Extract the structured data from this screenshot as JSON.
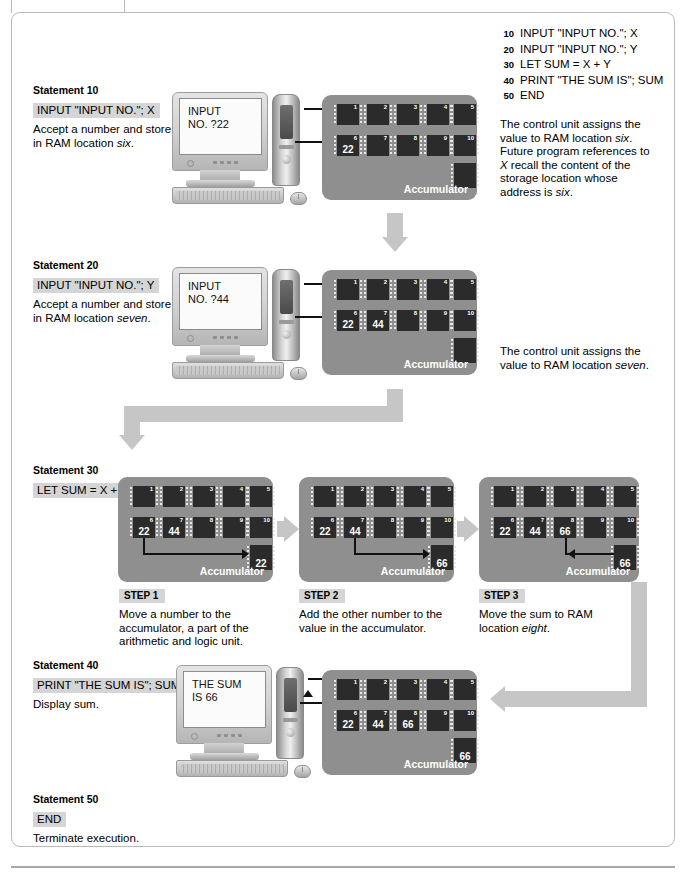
{
  "program_listing": [
    {
      "line": "10",
      "code": "INPUT \"INPUT NO.\"; X"
    },
    {
      "line": "20",
      "code": "INPUT \"INPUT NO.\"; Y"
    },
    {
      "line": "30",
      "code": "LET SUM = X + Y"
    },
    {
      "line": "40",
      "code": "PRINT \"THE SUM IS\"; SUM"
    },
    {
      "line": "50",
      "code": "END"
    }
  ],
  "statements": {
    "s10": {
      "title": "Statement 10",
      "code": "INPUT \"INPUT NO.\"; X",
      "desc_pre": "Accept a number and store it in RAM location ",
      "desc_em": "six",
      "desc_post": "."
    },
    "s20": {
      "title": "Statement 20",
      "code": "INPUT \"INPUT NO.\"; Y",
      "desc_pre": "Accept a number and store it in RAM location ",
      "desc_em": "seven",
      "desc_post": "."
    },
    "s30": {
      "title": "Statement 30",
      "code": "LET SUM = X + Y"
    },
    "s40": {
      "title": "Statement 40",
      "code": "PRINT \"THE SUM IS\"; SUM",
      "desc": "Display sum."
    },
    "s50": {
      "title": "Statement 50",
      "code": "END",
      "desc": "Terminate execution."
    }
  },
  "notes": {
    "n10_a": "The control unit assigns the value to RAM location ",
    "n10_em1": "six",
    "n10_b": ". Future program references to ",
    "n10_em2": "X",
    "n10_c": " recall the content of the storage location whose address is ",
    "n10_em3": "six",
    "n10_d": ".",
    "n20_a": "The control unit assigns the value to RAM location ",
    "n20_em": "seven",
    "n20_b": "."
  },
  "steps": [
    {
      "title": "STEP 1",
      "desc": "Move a number to the accumulator, a part of the arithmetic and logic unit."
    },
    {
      "title": "STEP 2",
      "desc": "Add the other number to the value in the accumulator."
    },
    {
      "title": "STEP 3",
      "desc_pre": "Move the sum to RAM location ",
      "desc_em": "eight",
      "desc_post": "."
    }
  ],
  "monitors": {
    "m10_line1": "INPUT",
    "m10_line2": "NO. ?22",
    "m20_line1": "INPUT",
    "m20_line2": "NO. ?44",
    "m40_line1": "THE SUM",
    "m40_line2": "IS 66"
  },
  "ram_blocks": {
    "r10": {
      "accumulator_label": "Accumulator",
      "accumulator_value": "",
      "chips": [
        {
          "idx": "1",
          "val": ""
        },
        {
          "idx": "2",
          "val": ""
        },
        {
          "idx": "3",
          "val": ""
        },
        {
          "idx": "4",
          "val": ""
        },
        {
          "idx": "5",
          "val": ""
        },
        {
          "idx": "6",
          "val": "22"
        },
        {
          "idx": "7",
          "val": ""
        },
        {
          "idx": "8",
          "val": ""
        },
        {
          "idx": "9",
          "val": ""
        },
        {
          "idx": "10",
          "val": ""
        }
      ]
    },
    "r20": {
      "accumulator_label": "Accumulator",
      "accumulator_value": "",
      "chips": [
        {
          "idx": "1",
          "val": ""
        },
        {
          "idx": "2",
          "val": ""
        },
        {
          "idx": "3",
          "val": ""
        },
        {
          "idx": "4",
          "val": ""
        },
        {
          "idx": "5",
          "val": ""
        },
        {
          "idx": "6",
          "val": "22"
        },
        {
          "idx": "7",
          "val": "44"
        },
        {
          "idx": "8",
          "val": ""
        },
        {
          "idx": "9",
          "val": ""
        },
        {
          "idx": "10",
          "val": ""
        }
      ]
    },
    "r30a": {
      "accumulator_label": "Accumulator",
      "accumulator_value": "22",
      "chips": [
        {
          "idx": "1",
          "val": ""
        },
        {
          "idx": "2",
          "val": ""
        },
        {
          "idx": "3",
          "val": ""
        },
        {
          "idx": "4",
          "val": ""
        },
        {
          "idx": "5",
          "val": ""
        },
        {
          "idx": "6",
          "val": "22"
        },
        {
          "idx": "7",
          "val": "44"
        },
        {
          "idx": "8",
          "val": ""
        },
        {
          "idx": "9",
          "val": ""
        },
        {
          "idx": "10",
          "val": ""
        }
      ]
    },
    "r30b": {
      "accumulator_label": "Accumulator",
      "accumulator_value": "66",
      "chips": [
        {
          "idx": "1",
          "val": ""
        },
        {
          "idx": "2",
          "val": ""
        },
        {
          "idx": "3",
          "val": ""
        },
        {
          "idx": "4",
          "val": ""
        },
        {
          "idx": "5",
          "val": ""
        },
        {
          "idx": "6",
          "val": "22"
        },
        {
          "idx": "7",
          "val": "44"
        },
        {
          "idx": "8",
          "val": ""
        },
        {
          "idx": "9",
          "val": ""
        },
        {
          "idx": "10",
          "val": ""
        }
      ]
    },
    "r30c": {
      "accumulator_label": "Accumulator",
      "accumulator_value": "66",
      "chips": [
        {
          "idx": "1",
          "val": ""
        },
        {
          "idx": "2",
          "val": ""
        },
        {
          "idx": "3",
          "val": ""
        },
        {
          "idx": "4",
          "val": ""
        },
        {
          "idx": "5",
          "val": ""
        },
        {
          "idx": "6",
          "val": "22"
        },
        {
          "idx": "7",
          "val": "44"
        },
        {
          "idx": "8",
          "val": "66"
        },
        {
          "idx": "9",
          "val": ""
        },
        {
          "idx": "10",
          "val": ""
        }
      ]
    },
    "r40": {
      "accumulator_label": "Accumulator",
      "accumulator_value": "66",
      "chips": [
        {
          "idx": "1",
          "val": ""
        },
        {
          "idx": "2",
          "val": ""
        },
        {
          "idx": "3",
          "val": ""
        },
        {
          "idx": "4",
          "val": ""
        },
        {
          "idx": "5",
          "val": ""
        },
        {
          "idx": "6",
          "val": "22"
        },
        {
          "idx": "7",
          "val": "44"
        },
        {
          "idx": "8",
          "val": "66"
        },
        {
          "idx": "9",
          "val": ""
        },
        {
          "idx": "10",
          "val": ""
        }
      ]
    }
  },
  "colors": {
    "board": "#8f8f8f",
    "chip": "#2b2b2b",
    "code_highlight": "#d5d5d5",
    "flow_arrow": "#c6c6c6"
  }
}
